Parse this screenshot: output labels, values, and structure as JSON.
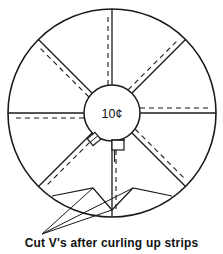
{
  "figure": {
    "background_color": "#ffffff",
    "line_color": "#1a1a1a",
    "caption": "Cut V's after curling up strips",
    "coin": {
      "label": "10¢",
      "center_x": 112,
      "center_y": 113,
      "radius": 28
    },
    "disc": {
      "center_x": 112,
      "center_y": 113,
      "radius": 104,
      "stroke_width": 1.6
    },
    "spokes": [
      {
        "name": "spoke-top",
        "angle_deg": -90,
        "solid": true,
        "dashed_offset": -4
      },
      {
        "name": "spoke-upper-right",
        "angle_deg": -45,
        "solid": true,
        "dashed_offset": -5
      },
      {
        "name": "spoke-right",
        "angle_deg": 0,
        "solid": true,
        "dashed_offset": -5
      },
      {
        "name": "spoke-lower-right",
        "angle_deg": 45,
        "solid": true,
        "dashed_offset": -5
      },
      {
        "name": "spoke-bottom",
        "angle_deg": 90,
        "solid": true,
        "dashed_offset": -4
      },
      {
        "name": "spoke-lower-left",
        "angle_deg": 135,
        "solid": true,
        "dashed_offset": -5
      },
      {
        "name": "spoke-left",
        "angle_deg": 180,
        "solid": true,
        "dashed_offset": -5
      },
      {
        "name": "spoke-upper-left",
        "angle_deg": 225,
        "solid": true,
        "dashed_offset": -5
      }
    ],
    "clips": [
      {
        "name": "clip-left",
        "x": 94,
        "y": 139,
        "rotation": -40
      },
      {
        "name": "clip-right",
        "x": 118,
        "y": 145,
        "rotation": 0
      }
    ],
    "v_cuts": [
      {
        "name": "v-cut-left",
        "apex_x": 93,
        "apex_y": 208
      },
      {
        "name": "v-cut-right",
        "apex_x": 133,
        "apex_y": 208
      }
    ],
    "leader_target_x": 42,
    "leader_target_y": 234
  }
}
